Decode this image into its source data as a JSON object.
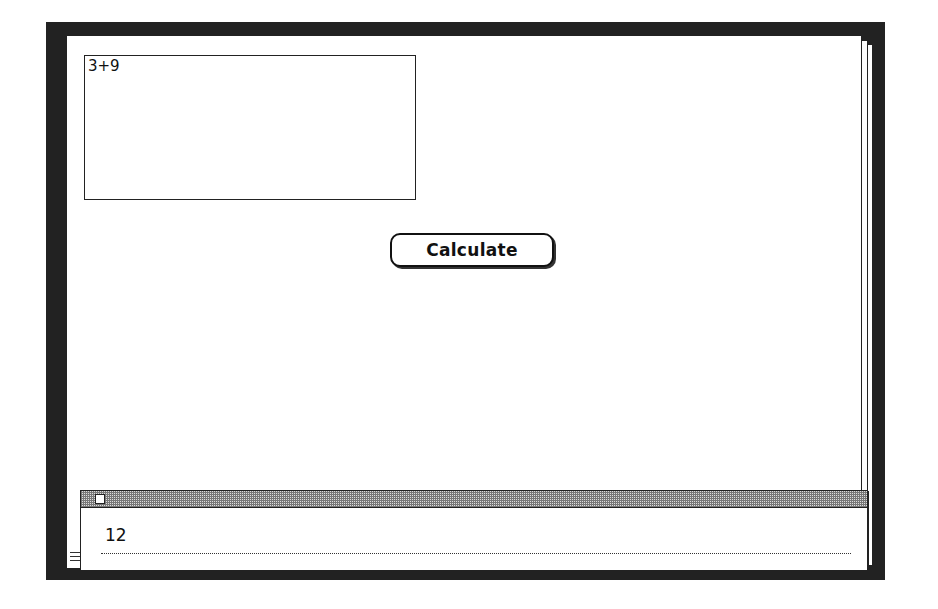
{
  "text_field": {
    "value": "3+9"
  },
  "calculate_button": {
    "label": "Calculate"
  },
  "message_window": {
    "result_text": "12"
  },
  "colors": {
    "desktop_pattern": "#555555",
    "window_background": "#ffffff",
    "ink": "#111111"
  }
}
